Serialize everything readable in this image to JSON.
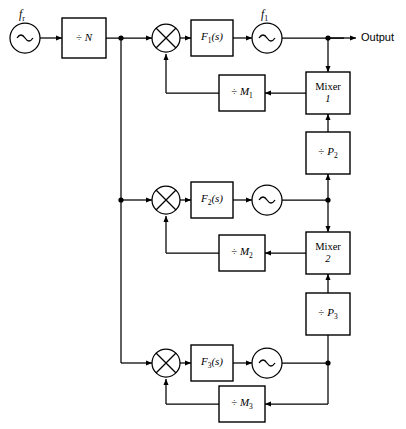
{
  "diagram": {
    "background_color": "#ffffff",
    "line_color": "#000000"
  },
  "sources": {
    "reference": {
      "label": "f",
      "subscript": "r",
      "icon": "sine-wave-oscillator"
    },
    "vco1": {
      "label": "f",
      "subscript": "1",
      "icon": "sine-wave-oscillator"
    },
    "vco2": {
      "label": "",
      "icon": "sine-wave-oscillator"
    },
    "vco3": {
      "label": "",
      "icon": "sine-wave-oscillator"
    }
  },
  "blocks": {
    "divide_n": {
      "sign": "÷",
      "name": "N"
    },
    "filter1": {
      "name": "F",
      "subscript": "1",
      "arg": "(s)"
    },
    "filter2": {
      "name": "F",
      "subscript": "2",
      "arg": "(s)"
    },
    "filter3": {
      "name": "F",
      "subscript": "3",
      "arg": "(s)"
    },
    "divide_m1": {
      "sign": "÷",
      "name": "M",
      "subscript": "1"
    },
    "divide_m2": {
      "sign": "÷",
      "name": "M",
      "subscript": "2"
    },
    "divide_m3": {
      "sign": "÷",
      "name": "M",
      "subscript": "3"
    },
    "divide_p2": {
      "sign": "÷",
      "name": "P",
      "subscript": "2"
    },
    "divide_p3": {
      "sign": "÷",
      "name": "P",
      "subscript": "3"
    },
    "mixer1": {
      "name": "Mixer",
      "number": "1"
    },
    "mixer2": {
      "name": "Mixer",
      "number": "2"
    }
  },
  "multipliers": {
    "mult1": {
      "icon": "cross-multiplier"
    },
    "mult2": {
      "icon": "cross-multiplier"
    },
    "mult3": {
      "icon": "cross-multiplier"
    }
  },
  "output": {
    "label": "Output"
  }
}
